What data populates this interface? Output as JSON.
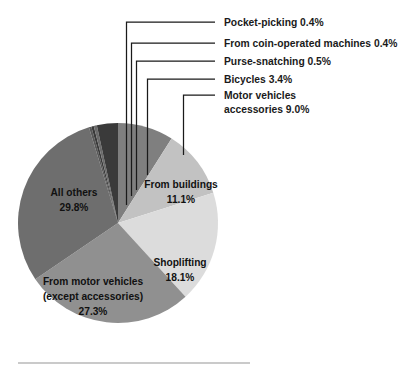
{
  "chart_data": {
    "type": "pie",
    "title": "",
    "subtitle": "",
    "xlabel": "",
    "ylabel": "",
    "legend_position": "callout-labels",
    "grid": false,
    "categories": [
      "Motor vehicles accessories",
      "Bicycles",
      "Purse-snatching",
      "From coin-operated machines",
      "Pocket-picking",
      "All others",
      "From motor vehicles (except accessories)",
      "Shoplifting",
      "From buildings"
    ],
    "values": [
      9.0,
      3.4,
      0.5,
      0.4,
      0.4,
      29.8,
      27.3,
      18.1,
      11.1
    ],
    "units": "percent",
    "slices": [
      {
        "name": "motor-vehicles-accessories",
        "label": "Motor vehicles accessories",
        "value": 9.0,
        "value_text": "9.0%",
        "color": "#7f7f7f",
        "label_placement": "callout"
      },
      {
        "name": "bicycles",
        "label": "Bicycles",
        "value": 3.4,
        "value_text": "3.4%",
        "color": "#3a3a3a",
        "label_placement": "callout"
      },
      {
        "name": "purse-snatching",
        "label": "Purse-snatching",
        "value": 0.5,
        "value_text": "0.5%",
        "color": "#6b6b6b",
        "label_placement": "callout"
      },
      {
        "name": "from-coin-operated-machines",
        "label": "From coin-operated machines",
        "value": 0.4,
        "value_text": "0.4%",
        "color": "#3a3a3a",
        "label_placement": "callout"
      },
      {
        "name": "pocket-picking",
        "label": "Pocket-picking",
        "value": 0.4,
        "value_text": "0.4%",
        "color": "#585858",
        "label_placement": "callout"
      },
      {
        "name": "all-others",
        "label": "All others",
        "value": 29.8,
        "value_text": "29.8%",
        "color": "#6e6e6e",
        "label_placement": "inside"
      },
      {
        "name": "from-motor-vehicles-except-accessories",
        "label": "From motor vehicles (except accessories)",
        "value": 27.3,
        "value_text": "27.3%",
        "color": "#909090",
        "label_placement": "inside"
      },
      {
        "name": "shoplifting",
        "label": "Shoplifting",
        "value": 18.1,
        "value_text": "18.1%",
        "color": "#dcdcdc",
        "label_placement": "inside"
      },
      {
        "name": "from-buildings",
        "label": "From buildings",
        "value": 11.1,
        "value_text": "11.1%",
        "color": "#c2c2c2",
        "label_placement": "inside"
      }
    ]
  },
  "callouts": [
    {
      "line1": "Pocket-picking 0.4%",
      "line2": ""
    },
    {
      "line1": "From coin-operated machines 0.4%",
      "line2": ""
    },
    {
      "line1": "Purse-snatching 0.5%",
      "line2": ""
    },
    {
      "line1": "Bicycles 3.4%",
      "line2": ""
    },
    {
      "line1": "Motor vehicles",
      "line2": "accessories 9.0%"
    }
  ],
  "inside_labels": [
    {
      "line1": "All others",
      "line2": "29.8%",
      "line3": ""
    },
    {
      "line1": "From buildings",
      "line2": "11.1%",
      "line3": ""
    },
    {
      "line1": "Shoplifting",
      "line2": "18.1%",
      "line3": ""
    },
    {
      "line1": "From motor vehicles",
      "line2": "(except accessories)",
      "line3": "27.3%"
    }
  ]
}
